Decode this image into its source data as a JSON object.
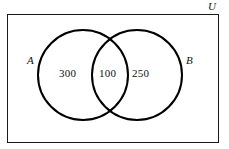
{
  "figure": {
    "type": "venn-diagram",
    "background_color": "#ffffff",
    "stroke_color": "#000000",
    "text_color": "#111111"
  },
  "universe": {
    "label": "U",
    "rect": {
      "x": 7,
      "y": 14,
      "width": 211,
      "height": 128
    },
    "border_width": 1
  },
  "sets": [
    {
      "id": "A",
      "label": "A",
      "cx": 83,
      "cy": 75,
      "r": 45,
      "stroke_width": 2
    },
    {
      "id": "B",
      "label": "B",
      "cx": 137,
      "cy": 75,
      "r": 45,
      "stroke_width": 2
    }
  ],
  "regions": [
    {
      "id": "a-only",
      "label": "A only",
      "value": "300"
    },
    {
      "id": "intersection",
      "label": "A and B",
      "value": "100"
    },
    {
      "id": "b-only",
      "label": "B only",
      "value": "250"
    }
  ],
  "chart_data": {
    "type": "venn",
    "title": "",
    "sets": [
      "A",
      "B"
    ],
    "universe_label": "U",
    "region_values": {
      "A_only": 300,
      "A_and_B": 100,
      "B_only": 250
    },
    "set_totals": {
      "A": 400,
      "B": 350
    },
    "annotations": [
      "A",
      "B",
      "U"
    ],
    "grid": false,
    "legend": "none"
  }
}
